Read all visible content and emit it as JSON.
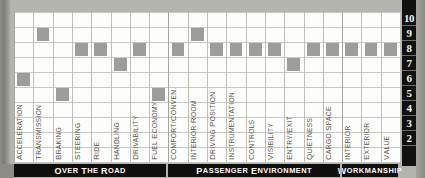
{
  "chart_data": {
    "type": "bar",
    "title": "",
    "subtitle": "",
    "xlabel": "",
    "ylabel": "",
    "ylim": [
      1,
      10
    ],
    "grid": true,
    "legend_position": "none",
    "scale_labels": [
      "10",
      "9",
      "8",
      "7",
      "6",
      "5",
      "4",
      "3",
      "2",
      "1"
    ],
    "categories": [
      "Acceleration",
      "Transmission",
      "Braking",
      "Steering",
      "Ride",
      "Handling",
      "Drivability",
      "Fuel Economy",
      "Comfort/Conven.",
      "Interior Room",
      "Driving Position",
      "Instrumentation",
      "Controls",
      "Visibility",
      "Entry/Exit",
      "Quietness",
      "Cargo Space",
      "Interior",
      "Exterior",
      "Value"
    ],
    "values": [
      6,
      9,
      5,
      8,
      8,
      7,
      8,
      5,
      8,
      9,
      8,
      8,
      8,
      8,
      7,
      8,
      8,
      8,
      8,
      8
    ],
    "groups": [
      {
        "label": "Over The Road",
        "start": 0,
        "end": 7
      },
      {
        "label": "Passenger Environment",
        "start": 8,
        "end": 16
      },
      {
        "label": "Workmanship",
        "start": 17,
        "end": 19
      }
    ],
    "bar_color": "#9d9d99",
    "panel_color": "#fdfdfb",
    "grid_color": "#c9c9c4",
    "band_color": "#0f0f0e",
    "scale_color": "#111110"
  }
}
